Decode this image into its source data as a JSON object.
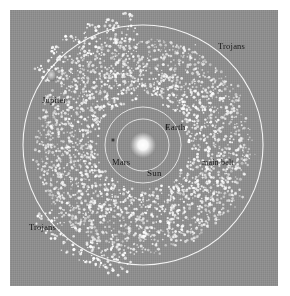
{
  "figure": {
    "background_color": "#ffffff",
    "panel_color": "#8d8d8d",
    "orbit_color": "#f2f2f2",
    "asteroid_color": "#ffffff",
    "label_color": "#141414"
  },
  "labels": {
    "trojans_top": "Trojans",
    "trojans_bottom": "Trojans",
    "jupiter": "Jupiter",
    "earth": "Earth",
    "mars": "Mars",
    "sun": "Sun",
    "main_belt": "main belt"
  },
  "chart_data": {
    "type": "scatter",
    "projection": "ecliptic plane, top-down",
    "center": {
      "x": 143,
      "y": 145
    },
    "orbits": [
      {
        "name": "Earth orbit",
        "radius_px": 26,
        "color": "#f0f0f0"
      },
      {
        "name": "Mars orbit",
        "radius_px": 38,
        "color": "#f0f0f0"
      },
      {
        "name": "Jupiter orbit",
        "radius_px": 120,
        "color": "#fafafa"
      }
    ],
    "bodies": [
      {
        "name": "Sun",
        "x": 143,
        "y": 145,
        "radius_px": 9,
        "color": "#ffffff",
        "label": "Sun"
      },
      {
        "name": "Earth",
        "x": 167,
        "y": 127,
        "radius_px": 2.2,
        "color": "#6a6a6a",
        "label": "Earth"
      },
      {
        "name": "Mars",
        "x": 113,
        "y": 140,
        "radius_px": 1.8,
        "color": "#3c3c3c",
        "label": "Mars"
      },
      {
        "name": "Jupiter",
        "x": 52,
        "y": 76,
        "radius_px": 4.5,
        "color": "#b8b8b8",
        "label": "Jupiter"
      }
    ],
    "populations": [
      {
        "name": "main belt",
        "label": "main belt",
        "shape": "annulus",
        "inner_radius_px": 45,
        "outer_radius_px": 108,
        "count": 2600,
        "color": "#ffffff"
      },
      {
        "name": "Trojans L4",
        "label": "Trojans",
        "shape": "cluster on Jupiter orbit",
        "center_angle_deg": 120,
        "orbit_radius_px": 120,
        "count": 150,
        "color": "#ffffff"
      },
      {
        "name": "Trojans L5",
        "label": "Trojans",
        "shape": "cluster on Jupiter orbit",
        "center_angle_deg": 240,
        "orbit_radius_px": 120,
        "count": 150,
        "color": "#ffffff"
      }
    ],
    "legend": "none",
    "grid": false,
    "axes": "none"
  }
}
